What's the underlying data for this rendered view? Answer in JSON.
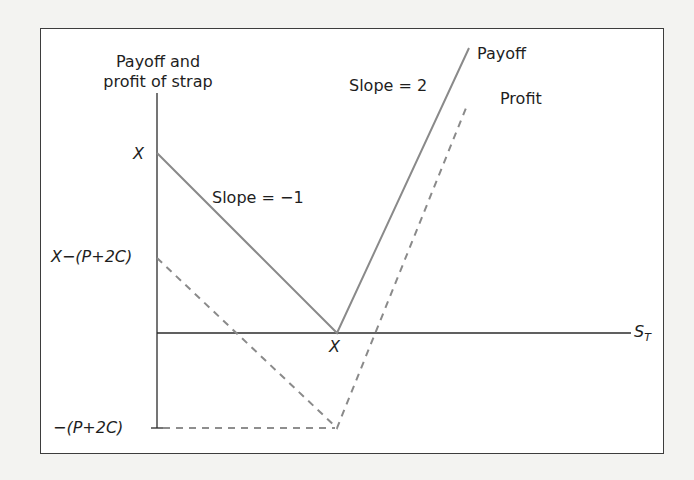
{
  "diagram": {
    "y_axis_title_line1": "Payoff and",
    "y_axis_title_line2": "profit of strap",
    "x_axis_label": "S",
    "x_axis_label_subscript": "T",
    "y_tick_x": "X",
    "y_tick_x_minus_cost": "X−(P+2C)",
    "y_tick_neg_cost": "−(P+2C)",
    "x_tick_strike": "X",
    "left_slope_label": "Slope = −1",
    "right_slope_label": "Slope = 2",
    "payoff_label": "Payoff",
    "profit_label": "Profit"
  },
  "series": [
    {
      "name": "Payoff",
      "style": "solid",
      "color": "#8a8a8a",
      "points": [
        [
          "0",
          "X"
        ],
        [
          "X",
          "0"
        ],
        [
          "high S_T",
          "slope 2"
        ]
      ]
    },
    {
      "name": "Profit",
      "style": "dashed",
      "color": "#8a8a8a",
      "points": [
        [
          "0",
          "X-(P+2C)"
        ],
        [
          "X",
          "-(P+2C)"
        ],
        [
          "high S_T",
          "slope 2"
        ]
      ]
    }
  ],
  "colors": {
    "axis": "#2b2b2b",
    "payoff_line": "#8a8a8a",
    "profit_line": "#8a8a8a",
    "frame": "#3d3d3d",
    "background": "#ffffff"
  }
}
